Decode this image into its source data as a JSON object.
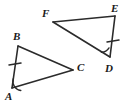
{
  "figure": {
    "width": 131,
    "height": 106,
    "background_color": "#ffffff",
    "stroke_color": "#2b2b2b",
    "stroke_width": 1.6,
    "label_color": "#1a1a1a"
  },
  "labels": {
    "A": "A",
    "B": "B",
    "C": "C",
    "D": "D",
    "E": "E",
    "F": "F"
  },
  "label_positions": {
    "A": {
      "x": 5,
      "y": 91
    },
    "B": {
      "x": 13,
      "y": 31
    },
    "C": {
      "x": 77,
      "y": 62
    },
    "D": {
      "x": 105,
      "y": 63
    },
    "E": {
      "x": 111,
      "y": 3
    },
    "F": {
      "x": 42,
      "y": 8
    }
  },
  "vertices": {
    "A": {
      "x": 12,
      "y": 88
    },
    "B": {
      "x": 18,
      "y": 46
    },
    "C": {
      "x": 73,
      "y": 70
    },
    "D": {
      "x": 110,
      "y": 57
    },
    "E": {
      "x": 115,
      "y": 16
    },
    "F": {
      "x": 53,
      "y": 22
    }
  },
  "shapes": [
    {
      "name": "triangle-abc",
      "points": "12,88 18,46 73,70",
      "edges": [
        "AB",
        "BC",
        "CA"
      ]
    },
    {
      "name": "triangle-def",
      "points": "53,22 115,16 110,57",
      "edges": [
        "FE",
        "ED",
        "DF"
      ]
    }
  ],
  "marks": {
    "tick_ab": {
      "name": "congruence-tick-side-ab",
      "x1": 9,
      "y1": 65,
      "x2": 21,
      "y2": 63,
      "segment": "AB"
    },
    "tick_de": {
      "name": "congruence-tick-side-de",
      "x1": 107,
      "y1": 42,
      "x2": 119,
      "y2": 40,
      "segment": "DE"
    },
    "arc_a": {
      "name": "angle-arc-a",
      "path": "M 13.3 78.8 A 9.2 9.2 0 0 0 20.8 90.5",
      "vertex": "A"
    },
    "arc_d": {
      "name": "angle-arc-d",
      "path": "M 101.4 52.3 A 9.2 9.2 0 0 0 109.0 47.9",
      "vertex": "D"
    }
  }
}
